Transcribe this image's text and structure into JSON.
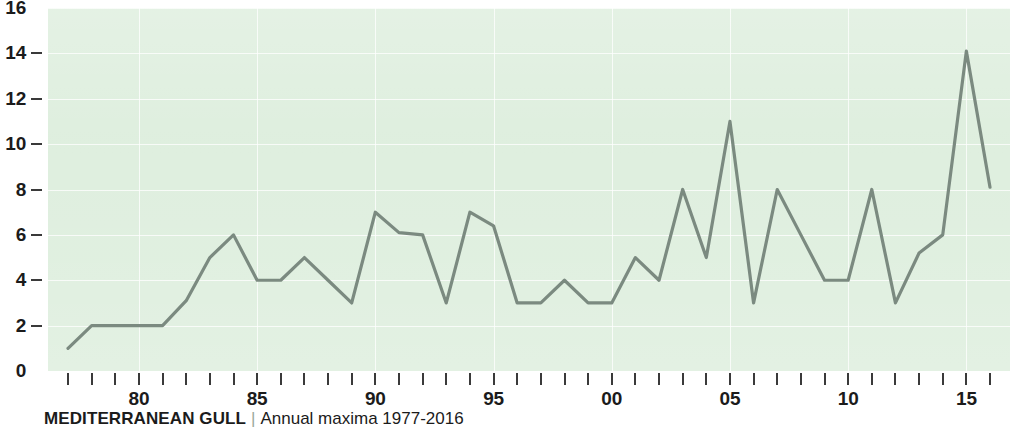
{
  "caption": {
    "title": "MEDITERRANEAN GULL",
    "separator": "|",
    "subtitle": "Annual maxima 1977-2016"
  },
  "colors": {
    "plot_background": "#ddeedd",
    "gridline": "#ffffff",
    "series_line": "#7b8a80",
    "axis_text": "#1b1b1b",
    "tick_mark": "#3a3a3a"
  },
  "chart_data": {
    "type": "line",
    "title": "MEDITERRANEAN GULL",
    "subtitle": "Annual maxima 1977-2016",
    "xlabel": "",
    "ylabel": "",
    "ylim": [
      0,
      16
    ],
    "xlim": [
      1977,
      2016
    ],
    "grid": true,
    "legend": "none",
    "y_ticks": [
      0,
      2,
      4,
      6,
      8,
      10,
      12,
      14,
      16
    ],
    "y_tick_labels": [
      "0",
      "2",
      "4",
      "6",
      "8",
      "10",
      "12",
      "14",
      "16"
    ],
    "x_ticks": [
      1977,
      1978,
      1979,
      1980,
      1981,
      1982,
      1983,
      1984,
      1985,
      1986,
      1987,
      1988,
      1989,
      1990,
      1991,
      1992,
      1993,
      1994,
      1995,
      1996,
      1997,
      1998,
      1999,
      2000,
      2001,
      2002,
      2003,
      2004,
      2005,
      2006,
      2007,
      2008,
      2009,
      2010,
      2011,
      2012,
      2013,
      2014,
      2015,
      2016
    ],
    "x_tick_labels": [
      {
        "year": 1980,
        "label": "80"
      },
      {
        "year": 1985,
        "label": "85"
      },
      {
        "year": 1990,
        "label": "90"
      },
      {
        "year": 1995,
        "label": "95"
      },
      {
        "year": 2000,
        "label": "00"
      },
      {
        "year": 2005,
        "label": "05"
      },
      {
        "year": 2010,
        "label": "10"
      },
      {
        "year": 2015,
        "label": "15"
      }
    ],
    "x_gridline_years": [
      1980,
      1985,
      1990,
      1995,
      2000,
      2005,
      2010,
      2015
    ],
    "x": [
      1977,
      1978,
      1979,
      1980,
      1981,
      1982,
      1983,
      1984,
      1985,
      1986,
      1987,
      1988,
      1989,
      1990,
      1991,
      1992,
      1993,
      1994,
      1995,
      1996,
      1997,
      1998,
      1999,
      2000,
      2001,
      2002,
      2003,
      2004,
      2005,
      2006,
      2007,
      2008,
      2009,
      2010,
      2011,
      2012,
      2013,
      2014,
      2015,
      2016
    ],
    "values": [
      1,
      2,
      2,
      2,
      2,
      3.1,
      5,
      6,
      4,
      4,
      5,
      4,
      3,
      7,
      6.1,
      6,
      3,
      7,
      6.4,
      3,
      3,
      4,
      3,
      3,
      5,
      4,
      8,
      5,
      11,
      3,
      8,
      6,
      4,
      4,
      8,
      3,
      5.2,
      6,
      14.1,
      8.1
    ],
    "series": [
      {
        "name": "Annual maxima",
        "values": [
          1,
          2,
          2,
          2,
          2,
          3.1,
          5,
          6,
          4,
          4,
          5,
          4,
          3,
          7,
          6.1,
          6,
          3,
          7,
          6.4,
          3,
          3,
          4,
          3,
          3,
          5,
          4,
          8,
          5,
          11,
          3,
          8,
          6,
          4,
          4,
          8,
          3,
          5.2,
          6,
          14.1,
          8.1
        ]
      }
    ]
  }
}
